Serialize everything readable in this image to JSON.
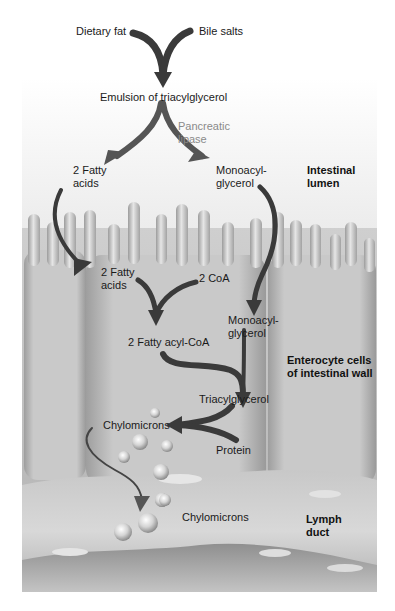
{
  "figure": {
    "colors": {
      "arrow": "#3a3a3a",
      "arrow_light": "#6a6a6a",
      "panel_light": "#f0f0f0",
      "cell": "#bdbdbd",
      "lymph": "#a8a8a8",
      "text": "#1a1a1a",
      "enzyme_text": "#8a8a8a"
    },
    "labels": {
      "dietary_fat": "Dietary fat",
      "bile_salts": "Bile salts",
      "emulsion": "Emulsion of triacylglycerol",
      "pancreatic_lipase_1": "Pancreatic",
      "pancreatic_lipase_2": "lipase",
      "fatty_acids_lumen_1": "2 Fatty",
      "fatty_acids_lumen_2": "acids",
      "monoacylglycerol_lumen_1": "Monoacyl-",
      "monoacylglycerol_lumen_2": "glycerol",
      "fatty_acids_cell_1": "2 Fatty",
      "fatty_acids_cell_2": "acids",
      "coa": "2 CoA",
      "monoacylglycerol_cell_1": "Monoacyl-",
      "monoacylglycerol_cell_2": "glycerol",
      "fatty_acyl_coa": "2 Fatty acyl-CoA",
      "triacylglycerol": "Triacylglycerol",
      "chylomicrons_cell": "Chylomicrons",
      "protein": "Protein",
      "chylomicrons_lymph": "Chylomicrons"
    },
    "regions": {
      "lumen_1": "Intestinal",
      "lumen_2": "lumen",
      "enterocyte_1": "Enterocyte cells",
      "enterocyte_2": "of intestinal wall",
      "lymph_1": "Lymph",
      "lymph_2": "duct"
    }
  }
}
